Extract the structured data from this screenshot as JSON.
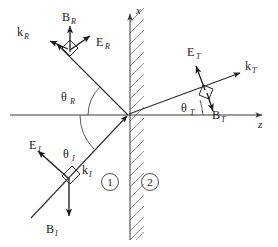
{
  "figure": {
    "type": "physics-ray-diagram"
  },
  "axes": {
    "vertical": {
      "label": "x",
      "label_sub": ""
    },
    "horizontal": {
      "label": "z",
      "label_sub": ""
    }
  },
  "regions": [
    {
      "id": "region-1",
      "label": "1"
    },
    {
      "id": "region-2",
      "label": "2"
    }
  ],
  "angles": [
    {
      "id": "theta-r",
      "symbol": "θ",
      "sub": "R"
    },
    {
      "id": "theta-i",
      "symbol": "θ",
      "sub": "I"
    },
    {
      "id": "theta-t",
      "symbol": "θ",
      "sub": "T"
    }
  ],
  "waves": {
    "incident": {
      "k": {
        "symbol": "k",
        "sub": "I"
      },
      "e": {
        "symbol": "E",
        "sub": "I"
      },
      "b": {
        "symbol": "B",
        "sub": "I"
      }
    },
    "reflected": {
      "k": {
        "symbol": "k",
        "sub": "R"
      },
      "e": {
        "symbol": "E",
        "sub": "R"
      },
      "b": {
        "symbol": "B",
        "sub": "R"
      }
    },
    "transmitted": {
      "k": {
        "symbol": "k",
        "sub": "T"
      },
      "e": {
        "symbol": "E",
        "sub": "T"
      },
      "b": {
        "symbol": "B",
        "sub": "T"
      }
    }
  },
  "colors": {
    "ink": "#1a1a1a",
    "ray": "#2b2b2b",
    "axis": "#3a3a3a",
    "hatch": "#777777",
    "background": "#ffffff"
  }
}
